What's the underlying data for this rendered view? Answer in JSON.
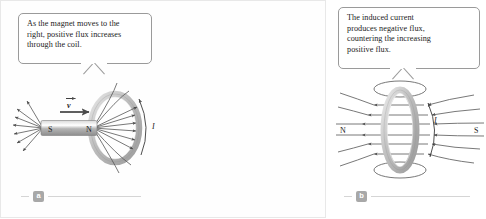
{
  "figure": {
    "accent_line": "#4a4a4a",
    "coil_color": "#b9b9b9",
    "magnet_color": "#9d9d9d",
    "badge_color": "#a8a8a8"
  },
  "panels": [
    {
      "id": "a",
      "badge": "a",
      "callout": {
        "line1": "As the magnet moves to the",
        "line2": "right, positive flux increases",
        "line3": "through the coil."
      },
      "labels": {
        "south_pole": "S",
        "north_pole": "N",
        "velocity": "v",
        "current": "I"
      }
    },
    {
      "id": "b",
      "badge": "b",
      "callout": {
        "line1": "The induced current",
        "line2": "produces negative flux,",
        "line3": "countering the increasing",
        "line4": "positive flux."
      },
      "labels": {
        "north_pole": "N",
        "south_pole": "S",
        "current": "I"
      }
    }
  ]
}
